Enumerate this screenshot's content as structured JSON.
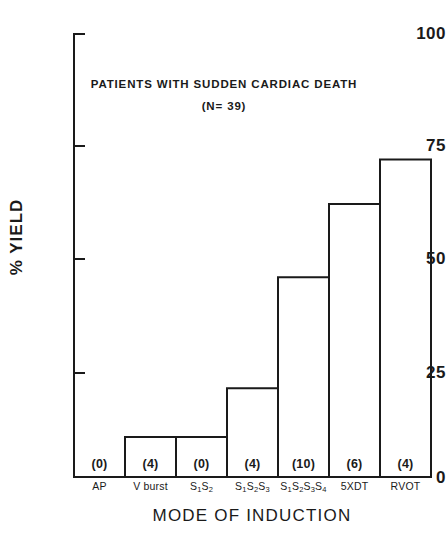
{
  "chart_data": {
    "type": "bar",
    "title": "PATIENTS WITH SUDDEN CARDIAC DEATH",
    "subtitle": "(N= 39)",
    "xlabel": "MODE OF INDUCTION",
    "ylabel": "% YIELD",
    "ylim": [
      0,
      100
    ],
    "yticks": [
      0,
      25,
      50,
      75,
      100
    ],
    "ytick_labels": [
      "0",
      "25",
      "50",
      "75",
      "100"
    ],
    "grid": false,
    "legend": null,
    "categories": [
      "AP",
      "V burst",
      "S1S2",
      "S1S2S3",
      "S1S2S3S4",
      "5XDT",
      "RVOT"
    ],
    "category_labels_html": [
      "AP",
      "V burst",
      "S<sub>1</sub>S<sub>2</sub>",
      "S<sub>1</sub>S<sub>2</sub>S<sub>3</sub>",
      "S<sub>1</sub>S<sub>2</sub>S<sub>3</sub>S<sub>4</sub>",
      "5XDT",
      "RVOT"
    ],
    "values": [
      0,
      9,
      9,
      20,
      45,
      61.5,
      71.5
    ],
    "annotations": [
      "(0)",
      "(4)",
      "(0)",
      "(4)",
      "(10)",
      "(6)",
      "(4)"
    ],
    "annotation_meaning": "number of patients in parentheses below each bar",
    "bar_style": {
      "fill": "#ffffff",
      "stroke": "#1a1a1a",
      "stroke_width": 2
    }
  },
  "colors": {
    "ink": "#1a1a1a",
    "paper": "#ffffff"
  }
}
